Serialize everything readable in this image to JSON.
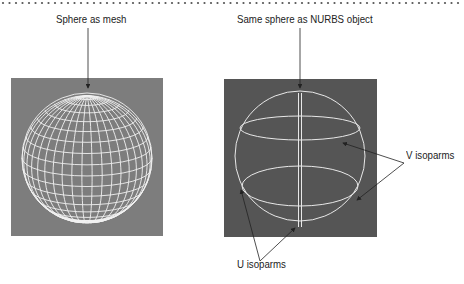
{
  "figure": {
    "left_panel": {
      "label": "Sphere as mesh",
      "description": "wireframe polygon mesh sphere"
    },
    "right_panel": {
      "label": "Same sphere as NURBS object",
      "description": "NURBS sphere showing isoparm curves"
    },
    "callouts": {
      "v_isoparms": "V isoparms",
      "u_isoparms": "U isoparms"
    },
    "colors": {
      "left_viewport_bg": "#7d7d7d",
      "right_viewport_bg": "#555555",
      "wire": "#f2f2f2",
      "callout_line": "#222222"
    }
  }
}
